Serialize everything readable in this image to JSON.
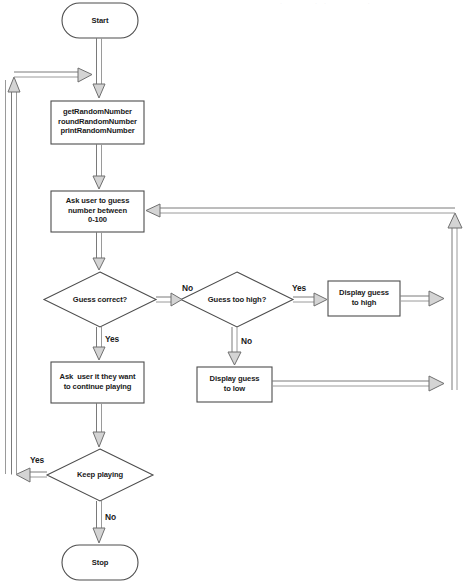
{
  "diagram": {
    "type": "flowchart",
    "colors": {
      "stroke": "#5a5a5a",
      "node_stroke": "#4d4d4d",
      "node_fill": "#ffffff",
      "arrow_fill": "#d4d4d4",
      "arrow_stroke": "#6b6b6b",
      "text": "#1a1a1a",
      "background": "#ffffff"
    },
    "nodes": [
      {
        "id": "start",
        "shape": "terminator",
        "label": "Start",
        "x": 62,
        "y": 3,
        "w": 76,
        "h": 35
      },
      {
        "id": "random",
        "shape": "process",
        "label": "getRandomNumber\nroundRandomNumber\nprintRandomNumber",
        "x": 51,
        "y": 101,
        "w": 93,
        "h": 43
      },
      {
        "id": "ask_guess",
        "shape": "process",
        "label": "Ask user to guess\nnumber between\n0-100",
        "x": 51,
        "y": 191,
        "w": 93,
        "h": 41
      },
      {
        "id": "guess_correct",
        "shape": "decision",
        "label": "Guess correct?",
        "x": 44,
        "y": 272,
        "w": 112,
        "h": 55
      },
      {
        "id": "guess_too_high",
        "shape": "decision",
        "label": "Guess too high?",
        "x": 181,
        "y": 272,
        "w": 112,
        "h": 55
      },
      {
        "id": "display_high",
        "shape": "process",
        "label": "Display guess\nto high",
        "x": 328,
        "y": 281,
        "w": 72,
        "h": 35
      },
      {
        "id": "display_low",
        "shape": "process",
        "label": "Display guess\nto low",
        "x": 197,
        "y": 367,
        "w": 75,
        "h": 35
      },
      {
        "id": "ask_continue",
        "shape": "process",
        "label": "Ask  user it they want\nto continue playing",
        "x": 51,
        "y": 362,
        "w": 93,
        "h": 41
      },
      {
        "id": "keep_playing",
        "shape": "decision",
        "label": "Keep playing",
        "x": 47,
        "y": 449,
        "w": 106,
        "h": 52
      },
      {
        "id": "stop",
        "shape": "terminator",
        "label": "Stop",
        "x": 62,
        "y": 545,
        "w": 76,
        "h": 35
      }
    ],
    "edge_labels": [
      {
        "id": "no-correct",
        "text": "No",
        "x": 182,
        "y": 283
      },
      {
        "id": "yes-too-high",
        "text": "Yes",
        "x": 292,
        "y": 283
      },
      {
        "id": "yes-correct",
        "text": "Yes",
        "x": 105,
        "y": 334
      },
      {
        "id": "no-too-high",
        "text": "No",
        "x": 241,
        "y": 336
      },
      {
        "id": "yes-keep",
        "text": "Yes",
        "x": 30,
        "y": 455
      },
      {
        "id": "no-keep",
        "text": "No",
        "x": 105,
        "y": 512
      }
    ],
    "edges": [
      {
        "id": "start-to-random",
        "from": "start",
        "to": "random"
      },
      {
        "id": "random-to-ask-guess",
        "from": "random",
        "to": "ask_guess"
      },
      {
        "id": "ask-guess-to-guess-correct",
        "from": "ask_guess",
        "to": "guess_correct"
      },
      {
        "id": "guess-correct-no",
        "from": "guess_correct",
        "to": "guess_too_high",
        "label": "No"
      },
      {
        "id": "guess-correct-yes",
        "from": "guess_correct",
        "to": "ask_continue",
        "label": "Yes"
      },
      {
        "id": "too-high-yes",
        "from": "guess_too_high",
        "to": "display_high",
        "label": "Yes"
      },
      {
        "id": "too-high-no",
        "from": "guess_too_high",
        "to": "display_low",
        "label": "No"
      },
      {
        "id": "display-high-return",
        "from": "display_high",
        "to": "ask_guess"
      },
      {
        "id": "display-low-return",
        "from": "display_low",
        "to": "ask_guess"
      },
      {
        "id": "ask-continue-to-keep",
        "from": "ask_continue",
        "to": "keep_playing"
      },
      {
        "id": "keep-playing-yes",
        "from": "keep_playing",
        "to": "random",
        "label": "Yes"
      },
      {
        "id": "keep-playing-no",
        "from": "keep_playing",
        "to": "stop",
        "label": "No"
      }
    ]
  }
}
